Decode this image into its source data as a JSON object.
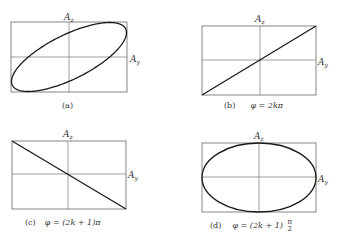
{
  "figure": {
    "panels": [
      {
        "id": "a",
        "caption_label": "(a)",
        "caption_formula": "",
        "axis_x": "A",
        "axis_x_sub": "y",
        "axis_z": "A",
        "axis_z_sub": "z",
        "curve": "tilted-ellipse",
        "box": [
          11,
          22,
          127,
          92
        ]
      },
      {
        "id": "b",
        "caption_label": "(b)",
        "caption_formula": "φ = 2kπ",
        "axis_x": "A",
        "axis_x_sub": "y",
        "axis_z": "A",
        "axis_z_sub": "z",
        "curve": "line-positive-slope",
        "box": [
          202,
          26,
          316,
          95
        ]
      },
      {
        "id": "c",
        "caption_label": "(c)",
        "caption_formula": "φ = (2k + 1)π",
        "axis_x": "A",
        "axis_x_sub": "y",
        "axis_z": "A",
        "axis_z_sub": "z",
        "curve": "line-negative-slope",
        "box": [
          12,
          141,
          126,
          209
        ]
      },
      {
        "id": "d",
        "caption_label": "(d)",
        "caption_formula_prefix": "φ = (2k + 1)",
        "caption_frac_num": "π",
        "caption_frac_den": "2",
        "axis_x": "A",
        "axis_x_sub": "y",
        "axis_z": "A",
        "axis_z_sub": "z",
        "curve": "upright-ellipse",
        "box": [
          202,
          143,
          316,
          212
        ]
      }
    ],
    "colors": {
      "frame": "#666666",
      "axis": "#777777",
      "curve": "#1a1a1a"
    }
  }
}
